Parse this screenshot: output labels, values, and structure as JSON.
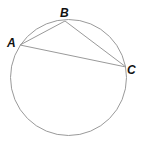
{
  "diagram": {
    "type": "inscribed-triangle",
    "circle": {
      "cx": 68.5,
      "cy": 77.5,
      "r": 58,
      "stroke": "#9a9a9a"
    },
    "segment_color": "#9a9a9a",
    "points": [
      {
        "label": "A",
        "x": 20,
        "y": 45,
        "lx": 7,
        "ly": 47
      },
      {
        "label": "B",
        "x": 65,
        "y": 21,
        "lx": 60,
        "ly": 17
      },
      {
        "label": "C",
        "x": 126,
        "y": 67,
        "lx": 127,
        "ly": 74
      }
    ],
    "segments": [
      [
        "A",
        "B"
      ],
      [
        "B",
        "C"
      ],
      [
        "A",
        "C"
      ]
    ]
  }
}
